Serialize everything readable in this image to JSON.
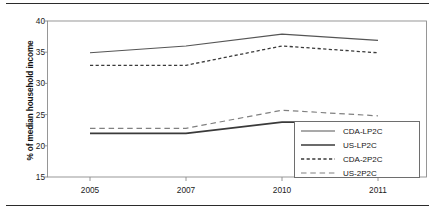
{
  "chart_data": {
    "type": "line",
    "title": "",
    "xlabel": "",
    "ylabel": "% of median household income",
    "categories": [
      "2005",
      "2007",
      "2010",
      "2011"
    ],
    "x_tick_labels": [
      "2005",
      "2007",
      "2010",
      "2011"
    ],
    "y_tick_labels": [
      "15",
      "20",
      "25",
      "30",
      "35",
      "40"
    ],
    "ylim": [
      15,
      40
    ],
    "grid": false,
    "legend_position": "lower-right",
    "series": [
      {
        "name": "CDA-LP2C",
        "style": "solid",
        "color": "#555555",
        "values": [
          34.9,
          36.0,
          37.9,
          36.9
        ]
      },
      {
        "name": "US-LP2C",
        "style": "solid",
        "color": "#3a3a3a",
        "values": [
          22.0,
          22.0,
          23.8,
          23.8
        ]
      },
      {
        "name": "CDA-2P2C",
        "style": "dotted",
        "color": "#3a3a3a",
        "values": [
          32.9,
          32.9,
          36.0,
          34.9
        ]
      },
      {
        "name": "US-2P2C",
        "style": "dashed",
        "color": "#808080",
        "values": [
          22.8,
          22.8,
          25.7,
          24.8
        ]
      }
    ]
  },
  "legend": {
    "entries": [
      {
        "label": "CDA-LP2C"
      },
      {
        "label": "US-LP2C"
      },
      {
        "label": "CDA-2P2C"
      },
      {
        "label": "US-2P2C"
      }
    ]
  }
}
